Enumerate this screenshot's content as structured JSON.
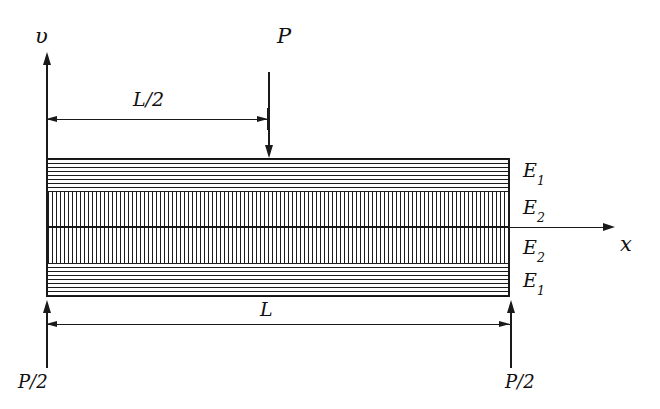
{
  "figure": {
    "background_color": "#ffffff",
    "line_color": "#1a1a1a"
  },
  "axes": {
    "vertical": {
      "label": "υ",
      "name": "v-axis",
      "direction": "up"
    },
    "horizontal": {
      "label": "x",
      "name": "x-axis",
      "direction": "right"
    }
  },
  "loads": {
    "applied": {
      "label": "P",
      "direction": "down",
      "location": "midspan"
    },
    "reaction_left": {
      "label": "P/2",
      "direction": "up"
    },
    "reaction_right": {
      "label": "P/2",
      "direction": "up"
    }
  },
  "dimensions": [
    {
      "label": "L/2",
      "name": "half-span-dimension"
    },
    {
      "label": "L",
      "name": "full-span-dimension"
    }
  ],
  "layers": [
    {
      "modulus": "E",
      "index": "1",
      "hatch": "horizontal",
      "position": "top"
    },
    {
      "modulus": "E",
      "index": "2",
      "hatch": "vertical",
      "position": "upper-core"
    },
    {
      "modulus": "E",
      "index": "2",
      "hatch": "vertical",
      "position": "lower-core"
    },
    {
      "modulus": "E",
      "index": "1",
      "hatch": "horizontal",
      "position": "bottom"
    }
  ]
}
